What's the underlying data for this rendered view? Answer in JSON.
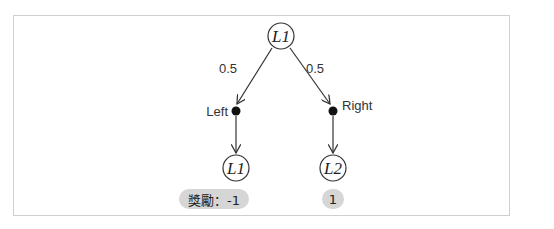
{
  "diagram": {
    "root": {
      "id": "root",
      "label": "L1"
    },
    "edges": [
      {
        "from": "root",
        "to": "left-action",
        "label": "0.5"
      },
      {
        "from": "root",
        "to": "right-action",
        "label": "0.5"
      },
      {
        "from": "left-action",
        "to": "left-state"
      },
      {
        "from": "right-action",
        "to": "right-state"
      }
    ],
    "actions": [
      {
        "id": "left-action",
        "label": "Left"
      },
      {
        "id": "right-action",
        "label": "Right"
      }
    ],
    "states": [
      {
        "id": "left-state",
        "label": "L1",
        "reward": "獎勵：-1"
      },
      {
        "id": "right-state",
        "label": "L2",
        "reward": "1"
      }
    ],
    "colors": {
      "line": "#333333",
      "node_fill": "#ffffff",
      "badge_bg": "#d6d6d6",
      "frame": "#cfcfcf"
    }
  }
}
